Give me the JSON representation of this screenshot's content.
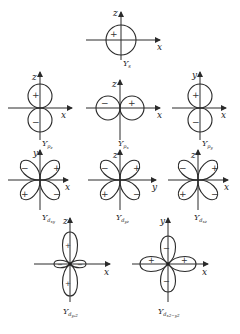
{
  "figure": {
    "orbitals": [
      {
        "id": "s",
        "label_main": "Y",
        "label_sub": "s",
        "axes": [
          "x",
          "z"
        ],
        "signs": [
          "+"
        ]
      },
      {
        "id": "pz",
        "label_main": "Y",
        "label_sub": "p",
        "label_subsub": "z",
        "axes": [
          "x",
          "z"
        ],
        "signs": [
          "+",
          "−"
        ]
      },
      {
        "id": "px",
        "label_main": "Y",
        "label_sub": "p",
        "label_subsub": "x",
        "axes": [
          "x",
          "z"
        ],
        "signs": [
          "−",
          "+"
        ]
      },
      {
        "id": "py",
        "label_main": "Y",
        "label_sub": "p",
        "label_subsub": "y",
        "axes": [
          "x",
          "y"
        ],
        "signs": [
          "+",
          "−"
        ]
      },
      {
        "id": "dxy",
        "label_main": "Y",
        "label_sub": "d",
        "label_subsub": "xy",
        "axes": [
          "x",
          "y"
        ],
        "signs": [
          "−",
          "+",
          "+",
          "−"
        ]
      },
      {
        "id": "dyz",
        "label_main": "Y",
        "label_sub": "d",
        "label_subsub": "yz",
        "axes": [
          "y",
          "z"
        ],
        "signs": [
          "−",
          "+",
          "+",
          "−"
        ]
      },
      {
        "id": "dxz",
        "label_main": "Y",
        "label_sub": "d",
        "label_subsub": "xz",
        "axes": [
          "x",
          "z"
        ],
        "signs": [
          "−",
          "+",
          "+",
          "−"
        ]
      },
      {
        "id": "dz2",
        "label_main": "Y",
        "label_sub": "d",
        "label_subsub": "y₂2",
        "axes": [
          "x",
          "z"
        ],
        "signs": [
          "+",
          "−",
          "−",
          "+"
        ]
      },
      {
        "id": "dx2y2",
        "label_main": "Y",
        "label_sub": "d",
        "label_subsub": "x2−y2",
        "axes": [
          "x",
          "y"
        ],
        "signs": [
          "−",
          "+",
          "+",
          "−"
        ]
      }
    ]
  }
}
